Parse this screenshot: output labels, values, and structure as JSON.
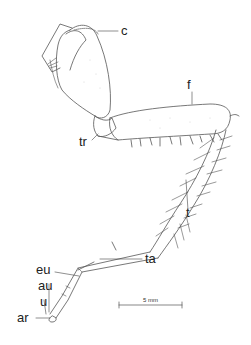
{
  "figure": {
    "labels": {
      "c": "c",
      "f": "f",
      "tr": "tr",
      "t": "t",
      "ta": "ta",
      "eu": "eu",
      "au": "au",
      "u": "u",
      "ar": "ar"
    },
    "scale_bar": {
      "label": "5 mm"
    },
    "colors": {
      "line": "#555555",
      "label": "#222222",
      "background": "#ffffff"
    }
  }
}
